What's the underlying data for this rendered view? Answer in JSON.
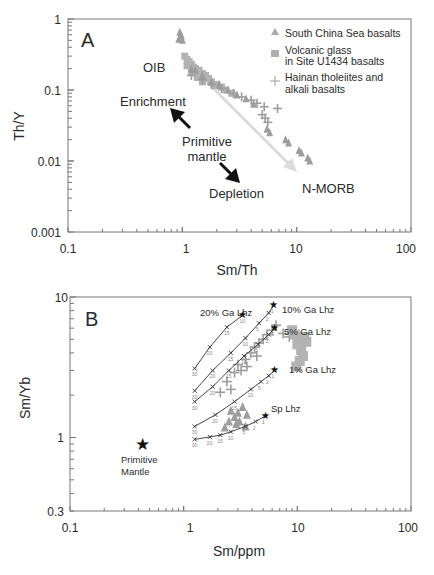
{
  "chart_data": [
    {
      "panel": "A",
      "type": "scatter",
      "xscale": "log",
      "yscale": "log",
      "xlabel": "Sm/Th",
      "ylabel": "Th/Y",
      "xlim": [
        0.1,
        100
      ],
      "ylim": [
        0.001,
        1
      ],
      "xticks": [
        "0.1",
        "1",
        "10",
        "100"
      ],
      "yticks": [
        "0.001",
        "0.01",
        "0.1",
        "1"
      ],
      "legend_position": "upper right",
      "legend": [
        {
          "marker": "triangle",
          "label": "South China Sea basalts"
        },
        {
          "marker": "square",
          "label": "Volcanic glass in Site U1434 basalts"
        },
        {
          "marker": "plus",
          "label": "Hainan tholeiites and alkali basalts"
        }
      ],
      "annotations": [
        "OIB",
        "Enrichment",
        "Primitive mantle",
        "Depletion",
        "N-MORB"
      ],
      "series": [
        {
          "name": "Volcanic glass in Site U1434 basalts",
          "marker": "square",
          "points": [
            [
              1.05,
              0.3
            ],
            [
              1.1,
              0.27
            ],
            [
              1.15,
              0.25
            ],
            [
              1.2,
              0.23
            ],
            [
              1.1,
              0.22
            ],
            [
              1.25,
              0.21
            ],
            [
              1.3,
              0.2
            ],
            [
              1.4,
              0.19
            ],
            [
              1.2,
              0.18
            ],
            [
              1.5,
              0.17
            ],
            [
              1.6,
              0.16
            ],
            [
              1.35,
              0.15
            ],
            [
              1.7,
              0.145
            ],
            [
              1.8,
              0.13
            ],
            [
              2.0,
              0.12
            ],
            [
              1.5,
              0.13
            ],
            [
              2.2,
              0.11
            ],
            [
              1.9,
              0.115
            ],
            [
              2.4,
              0.1
            ],
            [
              2.7,
              0.09
            ]
          ]
        },
        {
          "name": "South China Sea basalts",
          "marker": "triangle",
          "points": [
            [
              0.95,
              0.65
            ],
            [
              0.98,
              0.58
            ],
            [
              0.93,
              0.52
            ],
            [
              1.0,
              0.5
            ],
            [
              1.2,
              0.2
            ],
            [
              1.3,
              0.19
            ],
            [
              1.5,
              0.16
            ],
            [
              1.8,
              0.13
            ],
            [
              2.1,
              0.12
            ],
            [
              2.5,
              0.1
            ],
            [
              3.0,
              0.085
            ],
            [
              3.6,
              0.075
            ],
            [
              4.2,
              0.063
            ],
            [
              5.5,
              0.028
            ],
            [
              5.8,
              0.025
            ],
            [
              8.0,
              0.02
            ],
            [
              8.5,
              0.018
            ],
            [
              10.5,
              0.014
            ],
            [
              11.0,
              0.013
            ],
            [
              12.5,
              0.011
            ],
            [
              13.0,
              0.01
            ]
          ]
        },
        {
          "name": "Hainan tholeiites and alkali basalts",
          "marker": "plus",
          "points": [
            [
              1.2,
              0.16
            ],
            [
              1.5,
              0.14
            ],
            [
              1.8,
              0.12
            ],
            [
              2.2,
              0.105
            ],
            [
              2.8,
              0.09
            ],
            [
              3.3,
              0.08
            ],
            [
              4.0,
              0.072
            ],
            [
              4.5,
              0.065
            ],
            [
              5.2,
              0.058
            ],
            [
              6.8,
              0.055
            ],
            [
              5.0,
              0.045
            ],
            [
              5.3,
              0.04
            ],
            [
              5.6,
              0.035
            ]
          ]
        }
      ],
      "arrows": [
        {
          "label": "light grey trend",
          "from": [
            4.5,
            0.0038
          ],
          "to": [
            1.15,
            0.15
          ]
        },
        {
          "label": "light grey trend",
          "from": [
            1.15,
            0.15
          ],
          "to": [
            4.5,
            0.0038
          ]
        }
      ]
    },
    {
      "panel": "B",
      "type": "scatter",
      "xscale": "log",
      "yscale": "log",
      "xlabel": "Sm/ppm",
      "ylabel": "Sm/Yb",
      "xlim": [
        0.1,
        100
      ],
      "ylim": [
        0.3,
        10
      ],
      "xticks": [
        "0.1",
        "1",
        "10",
        "100"
      ],
      "yticks": [
        "0.3",
        "1",
        "10"
      ],
      "annotations": [
        "20% Ga Lhz",
        "10% Ga Lhz",
        "5% Ga Lhz",
        "1% Ga Lhz",
        "Sp Lhz",
        "Primitive Mantle"
      ],
      "primitive_mantle": [
        0.41,
        0.88
      ],
      "melting_curves": [
        {
          "name": "20% Ga Lhz",
          "points": [
            [
              1.25,
              3.1
            ],
            [
              1.7,
              4.4
            ],
            [
              2.4,
              6.1
            ],
            [
              3.3,
              7.4
            ]
          ],
          "labels": [
            "30",
            "20",
            "15",
            "10"
          ]
        },
        {
          "name": "10% Ga Lhz",
          "points": [
            [
              1.25,
              2.15
            ],
            [
              1.8,
              3.0
            ],
            [
              2.6,
              4.0
            ],
            [
              3.5,
              5.1
            ],
            [
              4.6,
              6.5
            ],
            [
              5.6,
              7.7
            ],
            [
              6.2,
              8.7
            ]
          ],
          "labels": [
            "30",
            "20",
            "15",
            "10",
            "5",
            "2",
            "1"
          ]
        },
        {
          "name": "5% Ga Lhz",
          "points": [
            [
              1.25,
              1.8
            ],
            [
              1.8,
              2.3
            ],
            [
              2.5,
              3.0
            ],
            [
              3.4,
              3.8
            ],
            [
              4.5,
              4.6
            ],
            [
              5.6,
              5.4
            ],
            [
              6.3,
              6.0
            ]
          ],
          "labels": [
            "30",
            "20",
            "15",
            "10",
            "5",
            "2",
            "1"
          ]
        },
        {
          "name": "1% Ga Lhz",
          "points": [
            [
              1.25,
              1.2
            ],
            [
              1.9,
              1.45
            ],
            [
              2.8,
              1.8
            ],
            [
              3.9,
              2.2
            ],
            [
              4.8,
              2.5
            ],
            [
              5.6,
              2.75
            ],
            [
              6.3,
              3.0
            ]
          ],
          "labels": [
            "30",
            "20",
            "15",
            "10",
            "5",
            "2",
            "1"
          ]
        },
        {
          "name": "Sp Lhz",
          "points": [
            [
              1.25,
              0.97
            ],
            [
              1.7,
              1.01
            ],
            [
              2.1,
              1.04
            ],
            [
              2.6,
              1.1
            ],
            [
              3.5,
              1.2
            ],
            [
              4.3,
              1.3
            ],
            [
              5.2,
              1.42
            ]
          ],
          "labels": [
            "30",
            "20",
            "15",
            "10",
            "5",
            "2",
            "1"
          ]
        }
      ],
      "series": [
        {
          "name": "Hainan tholeiites and alkali basalts",
          "marker": "plus",
          "points": [
            [
              2.1,
              2.1
            ],
            [
              2.4,
              2.5
            ],
            [
              2.8,
              2.9
            ],
            [
              3.0,
              3.3
            ],
            [
              3.2,
              3.0
            ],
            [
              3.5,
              3.6
            ],
            [
              3.9,
              4.0
            ],
            [
              4.2,
              4.4
            ],
            [
              4.6,
              4.7
            ],
            [
              5.0,
              5.0
            ],
            [
              5.4,
              5.4
            ],
            [
              6.0,
              5.8
            ],
            [
              6.5,
              6.3
            ],
            [
              7.5,
              5.5
            ],
            [
              8.5,
              5.2
            ],
            [
              2.6,
              2.2
            ],
            [
              3.6,
              3.2
            ],
            [
              4.4,
              3.8
            ]
          ]
        },
        {
          "name": "Volcanic glass in Site U1434 basalts",
          "marker": "square",
          "points": [
            [
              9.5,
              5.4
            ],
            [
              10.5,
              5.0
            ],
            [
              11.5,
              5.2
            ],
            [
              10.0,
              4.6
            ],
            [
              10.8,
              4.2
            ],
            [
              11.2,
              3.8
            ],
            [
              10.5,
              3.5
            ],
            [
              9.8,
              3.2
            ],
            [
              12.0,
              4.8
            ],
            [
              9.0,
              5.8
            ]
          ]
        },
        {
          "name": "South China Sea basalts",
          "marker": "triangle",
          "points": [
            [
              2.6,
              1.55
            ],
            [
              2.8,
              1.4
            ],
            [
              3.0,
              1.5
            ],
            [
              3.3,
              1.65
            ],
            [
              3.6,
              1.45
            ],
            [
              2.9,
              1.25
            ],
            [
              3.1,
              1.3
            ],
            [
              2.3,
              1.18
            ],
            [
              2.5,
              1.3
            ],
            [
              3.5,
              1.2
            ]
          ]
        }
      ]
    }
  ],
  "panelA": {
    "letter": "A",
    "xlabel": "Sm/Th",
    "ylabel": "Th/Y",
    "xticks": [
      "0.1",
      "1",
      "10",
      "100"
    ],
    "yticks": [
      "1",
      "0.1",
      "0.01",
      "0.001"
    ],
    "legend": {
      "item1": "South China Sea basalts",
      "item2a": "Volcanic glass",
      "item2b": "in Site U1434 basalts",
      "item3a": "Hainan tholeiites and",
      "item3b": "alkali basalts"
    },
    "labels": {
      "oib": "OIB",
      "enrichment": "Enrichment",
      "primitive1": "Primitive",
      "primitive2": "mantle",
      "depletion": "Depletion",
      "nmorb": "N-MORB"
    }
  },
  "panelB": {
    "letter": "B",
    "xlabel": "Sm/ppm",
    "ylabel": "Sm/Yb",
    "xticks": [
      "0.1",
      "1",
      "10",
      "100"
    ],
    "yticks": [
      "10",
      "1",
      "0.3"
    ],
    "labels": {
      "ga20": "20% Ga Lhz",
      "ga10": "10% Ga Lhz",
      "ga5": "5% Ga Lhz",
      "ga1": "1% Ga Lhz",
      "sp": "Sp Lhz",
      "pm1": "Primitive",
      "pm2": "Mantle"
    }
  },
  "colors": {
    "axis": "#555555",
    "text": "#2a2a2a",
    "data": "#9a9a9a",
    "trend_arrow": "#dcdcdc",
    "curve": "#333333"
  }
}
